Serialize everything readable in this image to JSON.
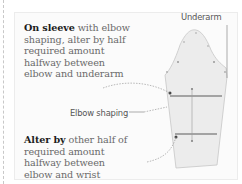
{
  "annotation_top": {
    "bold": "On sleeve",
    "rest": " with elbow shaping, alter by half required amount halfway between elbow and underarm"
  },
  "annotation_bottom": {
    "bold": "Alter by",
    "rest": " other half of required amount halfway between elbow and wrist"
  },
  "labels": {
    "underarm": "Underarm",
    "elbow_shaping": "Elbow shaping"
  },
  "colors": {
    "sleeve_fill": "#ebebeb",
    "sleeve_stroke": "#bdbdbd",
    "band": "#a3a3a3",
    "text_bold": "#1d1d1d",
    "text_body": "#6a6a6a"
  }
}
